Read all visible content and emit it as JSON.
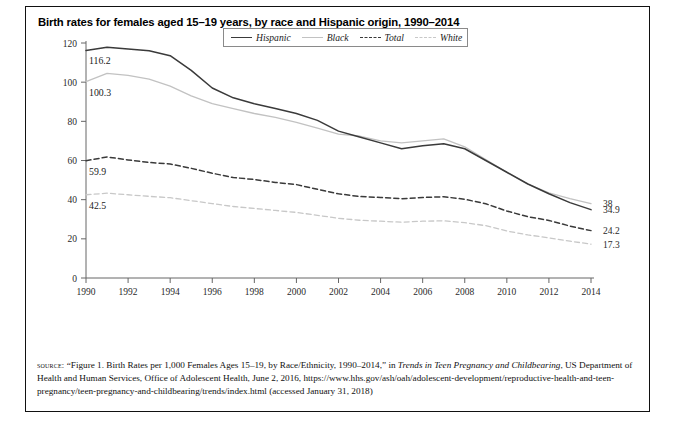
{
  "figure": {
    "title": "Birth rates for females aged 15–19 years, by race and Hispanic origin, 1990–2014"
  },
  "legend": {
    "items": [
      {
        "label": "Hispanic",
        "style": "solid",
        "color": "#3a3a3a"
      },
      {
        "label": "Black",
        "style": "solid",
        "color": "#c2c2c2"
      },
      {
        "label": "Total",
        "style": "dashed",
        "color": "#3a3a3a"
      },
      {
        "label": "White",
        "style": "dashed",
        "color": "#c8c8c8"
      }
    ]
  },
  "source": {
    "kicker": "source:",
    "line1_a": " “Figure 1. Birth Rates per 1,000 Females Ages 15–19, by Race/Ethnicity, 1990–2014,” in ",
    "line1_italic": "Trends in Teen Pregnancy and Childbearing",
    "line1_b": ", US Department of Health and Human Services, Office of Adolescent Health, June 2, 2016, https://www.hhs.gov/ash/oah/adolescent-development/reproductive-health-and-teen-pregnancy/teen-pregnancy-and-childbearing/trends/index.html (accessed January 31, 2018)"
  },
  "chart_data": {
    "type": "line",
    "title": "Birth rates for females aged 15–19 years, by race and Hispanic origin, 1990–2014",
    "xlabel": "",
    "ylabel": "",
    "xlim": [
      1990,
      2014
    ],
    "ylim": [
      0,
      120
    ],
    "yticks": [
      0,
      20,
      40,
      60,
      80,
      100,
      120
    ],
    "xticks": [
      1990,
      1992,
      1994,
      1996,
      1998,
      2000,
      2002,
      2004,
      2006,
      2008,
      2010,
      2012,
      2014
    ],
    "grid": false,
    "legend_position": "top-center",
    "x": [
      1990,
      1991,
      1992,
      1993,
      1994,
      1995,
      1996,
      1997,
      1998,
      1999,
      2000,
      2001,
      2002,
      2003,
      2004,
      2005,
      2006,
      2007,
      2008,
      2009,
      2010,
      2011,
      2012,
      2013,
      2014
    ],
    "series": [
      {
        "name": "Hispanic",
        "style": "solid",
        "color": "#3a3a3a",
        "start_label": "116.2",
        "end_label": "34.9",
        "values": [
          116.2,
          117.8,
          117.0,
          116.0,
          113.5,
          106.0,
          97.0,
          92.0,
          89.0,
          86.5,
          84.0,
          80.5,
          75.0,
          72.0,
          69.0,
          66.0,
          67.5,
          68.5,
          66.0,
          60.0,
          54.0,
          48.0,
          43.0,
          38.5,
          34.9
        ]
      },
      {
        "name": "Black",
        "style": "solid",
        "color": "#c2c2c2",
        "start_label": "100.3",
        "end_label": "38",
        "values": [
          100.3,
          104.5,
          103.5,
          101.5,
          98.0,
          93.0,
          89.0,
          86.5,
          84.0,
          82.0,
          79.5,
          76.5,
          73.5,
          72.5,
          70.0,
          69.0,
          70.0,
          71.0,
          67.0,
          60.5,
          54.0,
          48.0,
          43.5,
          40.5,
          38.0
        ]
      },
      {
        "name": "Total",
        "style": "dashed",
        "color": "#3a3a3a",
        "start_label": "59.9",
        "end_label": "24.2",
        "values": [
          59.9,
          61.8,
          60.3,
          59.0,
          58.2,
          56.0,
          53.5,
          51.3,
          50.3,
          48.8,
          47.7,
          45.3,
          43.0,
          41.6,
          41.1,
          40.5,
          41.1,
          41.5,
          40.2,
          37.9,
          34.2,
          31.3,
          29.4,
          26.5,
          24.2
        ]
      },
      {
        "name": "White",
        "style": "dashed",
        "color": "#c8c8c8",
        "start_label": "42.5",
        "end_label": "17.3",
        "values": [
          42.5,
          43.3,
          42.5,
          41.7,
          41.0,
          39.5,
          38.0,
          36.5,
          35.5,
          34.5,
          33.5,
          32.0,
          30.5,
          29.5,
          29.0,
          28.5,
          29.0,
          29.2,
          28.3,
          26.7,
          24.0,
          22.0,
          20.5,
          18.8,
          17.3
        ]
      }
    ]
  }
}
